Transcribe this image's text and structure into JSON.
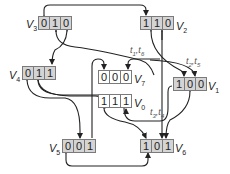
{
  "diagram": {
    "type": "state transition graph (3-bit boolean states)",
    "nodes": [
      {
        "id": "V0",
        "label": "V",
        "sub": "0",
        "bits": [
          "1",
          "1",
          "1"
        ],
        "fill": "#ffffff"
      },
      {
        "id": "V1",
        "label": "V",
        "sub": "1",
        "bits": [
          "1",
          "0",
          "0"
        ],
        "fill": "#d4d4d4"
      },
      {
        "id": "V2",
        "label": "V",
        "sub": "2",
        "bits": [
          "1",
          "1",
          "0"
        ],
        "fill": "#d4d4d4"
      },
      {
        "id": "V3",
        "label": "V",
        "sub": "3",
        "bits": [
          "0",
          "1",
          "0"
        ],
        "fill": "#d4d4d4"
      },
      {
        "id": "V4",
        "label": "V",
        "sub": "4",
        "bits": [
          "0",
          "1",
          "1"
        ],
        "fill": "#d4d4d4"
      },
      {
        "id": "V5",
        "label": "V",
        "sub": "5",
        "bits": [
          "0",
          "0",
          "1"
        ],
        "fill": "#d4d4d4"
      },
      {
        "id": "V6",
        "label": "V",
        "sub": "6",
        "bits": [
          "1",
          "0",
          "1"
        ],
        "fill": "#d4d4d4"
      },
      {
        "id": "V7",
        "label": "V",
        "sub": "7",
        "bits": [
          "0",
          "0",
          "0"
        ],
        "fill": "#ffffff"
      }
    ],
    "edge_labels": [
      {
        "text": "t1,t6",
        "near": "V7"
      },
      {
        "text": "t2,t5",
        "near": "V1"
      },
      {
        "text": "t3,t4",
        "near": "V0"
      }
    ],
    "edges": [
      {
        "from": "V3",
        "to": "V2",
        "bidirectional": true
      },
      {
        "from": "V3",
        "to": "V4",
        "bidirectional": true
      },
      {
        "from": "V3",
        "to": "V7"
      },
      {
        "from": "V2",
        "to": "V1",
        "bidirectional": true
      },
      {
        "from": "V2",
        "to": "V7"
      },
      {
        "from": "V2",
        "to": "V6"
      },
      {
        "from": "V4",
        "to": "V5",
        "bidirectional": true
      },
      {
        "from": "V4",
        "to": "V0",
        "bidirectional": true
      },
      {
        "from": "V5",
        "to": "V7"
      },
      {
        "from": "V5",
        "to": "V6",
        "bidirectional": true
      },
      {
        "from": "V0",
        "to": "V6",
        "bidirectional": true
      },
      {
        "from": "V0",
        "to": "V1"
      },
      {
        "from": "V1",
        "to": "V6",
        "bidirectional": true
      }
    ]
  }
}
